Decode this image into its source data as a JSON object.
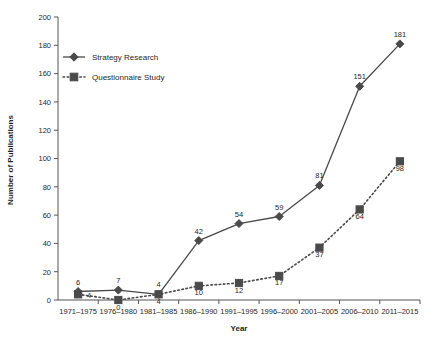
{
  "chart_data": {
    "type": "line",
    "title": "",
    "xlabel": "Year",
    "ylabel": "Number of Publications",
    "categories": [
      "1971–1975",
      "1976–1980",
      "1981–1985",
      "1986–1990",
      "1991–1995",
      "1996–2000",
      "2001–2005",
      "2006–2010",
      "2011–2015"
    ],
    "series": [
      {
        "name": "Strategy Research",
        "marker": "diamond",
        "line_style": "solid",
        "color": "#4a4a4a",
        "values": [
          6,
          7,
          4,
          42,
          54,
          59,
          81,
          151,
          181
        ]
      },
      {
        "name": "Questionnaire Study",
        "marker": "square",
        "line_style": "dotted",
        "color": "#4a4a4a",
        "values": [
          4,
          0,
          4,
          10,
          12,
          17,
          37,
          64,
          98
        ]
      }
    ],
    "ylim": [
      0,
      200
    ],
    "ytick_step": 20,
    "yticks": [
      0,
      20,
      40,
      60,
      80,
      100,
      120,
      140,
      160,
      180,
      200
    ],
    "grid": false,
    "legend_position": "top-left-inside",
    "data_labels": true
  },
  "axis": {
    "y_title": "Number of Publications",
    "x_title": "Year"
  },
  "legend": {
    "entries": [
      {
        "label": "Strategy Research",
        "marker": "diamond-marker-icon"
      },
      {
        "label": "Questionnaire Study",
        "marker": "square-marker-icon"
      }
    ]
  }
}
